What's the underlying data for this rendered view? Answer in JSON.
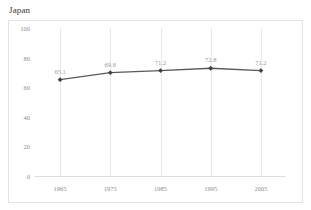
{
  "chart_title": "Japan",
  "colors": {
    "line": "#595959",
    "marker": "#404040",
    "gridline": "#e8e8e8",
    "frame": "#e2e2e2",
    "tick_text": "#8e8e8e",
    "label_text": "#9a9a9a",
    "title_text": "#3a3a3a",
    "background": "#ffffff"
  },
  "chart_data": {
    "type": "line",
    "title": "Japan",
    "subtitle": "",
    "xlabel": "",
    "ylabel": "",
    "categories": [
      "1965",
      "1975",
      "1985",
      "1995",
      "2005"
    ],
    "x": [
      1965,
      1975,
      1985,
      1995,
      2005
    ],
    "values": [
      65.1,
      69.8,
      71.2,
      72.8,
      71.2
    ],
    "data_labels": [
      "65.1",
      "69.8",
      "71.2",
      "72.8",
      "71.2"
    ],
    "ylim": [
      0,
      100
    ],
    "y_ticks": [
      100,
      80,
      60,
      40,
      20,
      0
    ],
    "y_tick_labels": [
      "100",
      "80",
      "60",
      "40",
      "20",
      "0"
    ],
    "x_tick_labels": [
      "1965",
      "1975",
      "1985",
      "1995",
      "2005"
    ],
    "grid": {
      "vertical": true,
      "horizontal": false
    },
    "legend": {
      "visible": false,
      "position": "none"
    },
    "markers": "diamond",
    "series": [
      {
        "name": "Japan",
        "values": [
          65.1,
          69.8,
          71.2,
          72.8,
          71.2
        ]
      }
    ]
  }
}
